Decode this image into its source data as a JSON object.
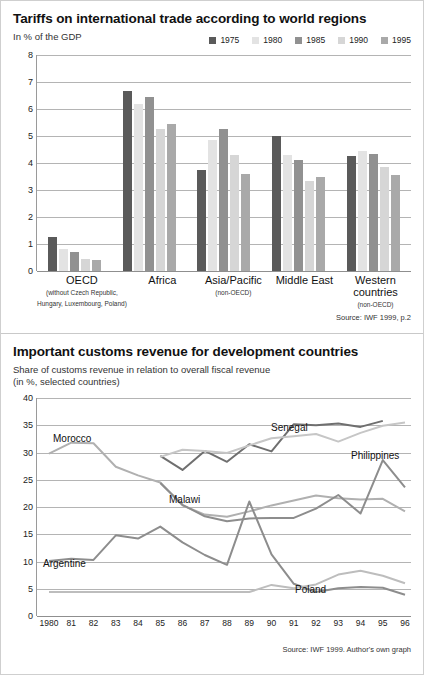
{
  "chart_data": [
    {
      "type": "bar",
      "title": "Tariffs on international trade according to world regions",
      "subtitle": "In % of the GDP",
      "ylabel": "",
      "xlabel": "",
      "ylim": [
        0,
        8
      ],
      "yticks": [
        0,
        1,
        2,
        3,
        4,
        5,
        6,
        7,
        8
      ],
      "grid": true,
      "legend_position": "top-right",
      "source": "Source: IWF 1999, p.2",
      "categories": [
        {
          "name": "OECD",
          "note": "(without Czech Republic,\nHungary, Luxembourg, Poland)"
        },
        {
          "name": "Africa",
          "note": ""
        },
        {
          "name": "Asia/Pacific",
          "note": "(non-OECD)"
        },
        {
          "name": "Middle East",
          "note": ""
        },
        {
          "name": "Western countries",
          "note": "(non-OECD)"
        }
      ],
      "series": [
        {
          "name": "1975",
          "color": "#5a5a5a",
          "values": [
            1.25,
            6.65,
            3.75,
            5.0,
            4.25
          ]
        },
        {
          "name": "1980",
          "color": "#e3e3e3",
          "values": [
            0.8,
            6.2,
            4.85,
            4.3,
            4.45
          ]
        },
        {
          "name": "1985",
          "color": "#919191",
          "values": [
            0.7,
            6.45,
            5.25,
            4.1,
            4.35
          ]
        },
        {
          "name": "1990",
          "color": "#d6d6d6",
          "values": [
            0.45,
            5.25,
            4.3,
            3.35,
            3.85
          ]
        },
        {
          "name": "1995",
          "color": "#a9a9a9",
          "values": [
            0.4,
            5.45,
            3.6,
            3.5,
            3.55
          ]
        }
      ]
    },
    {
      "type": "line",
      "title": "Important customs revenue for development countries",
      "subtitle_line1": "Share of customs revenue in relation to overall fiscal revenue",
      "subtitle_line2": "(in %, selected countries)",
      "ylabel": "",
      "xlabel": "",
      "ylim": [
        0,
        40
      ],
      "yticks": [
        0,
        5,
        10,
        15,
        20,
        25,
        30,
        35,
        40
      ],
      "grid": true,
      "source": "Source: IWF 1999. Author's own graph",
      "x": [
        "1980",
        "81",
        "82",
        "83",
        "84",
        "85",
        "86",
        "87",
        "88",
        "89",
        "90",
        "91",
        "92",
        "93",
        "94",
        "95",
        "96"
      ],
      "series": [
        {
          "name": "Morocco",
          "color": "#b0b0b0",
          "values": [
            29.8,
            31.8,
            31.7,
            27.4,
            25.8,
            24.5,
            20.3,
            18.6,
            18.2,
            19.2,
            20.3,
            21.2,
            22.1,
            21.6,
            21.4,
            21.5,
            19.2
          ],
          "label_x": 40,
          "label_y": 35
        },
        {
          "name": "Senegal",
          "color": "#6f6f6f",
          "values": [
            null,
            null,
            null,
            null,
            null,
            29.4,
            26.8,
            30.3,
            28.3,
            31.5,
            30.2,
            35.2,
            35.0,
            35.3,
            34.7,
            35.8,
            null
          ],
          "label_x": 258,
          "label_y": 24
        },
        {
          "name": "Philippines",
          "color": "#c6c6c6",
          "values": [
            null,
            null,
            null,
            null,
            null,
            29.2,
            30.5,
            30.3,
            29.9,
            31.3,
            32.6,
            33.0,
            33.4,
            32.0,
            33.6,
            34.9,
            35.5
          ],
          "label_x": 338,
          "label_y": 52
        },
        {
          "name": "Malawi",
          "color": "#8d8d8d",
          "values": [
            null,
            null,
            null,
            null,
            null,
            24.4,
            20.4,
            18.3,
            17.4,
            17.9,
            18.0,
            18.0,
            19.7,
            22.2,
            18.8,
            28.6,
            23.6
          ],
          "label_x": 156,
          "label_y": 96
        },
        {
          "name": "Argentine",
          "color": "#8d8d8d",
          "values": [
            10.1,
            10.5,
            10.3,
            14.8,
            14.2,
            16.4,
            13.5,
            11.2,
            9.4,
            21.0,
            11.3,
            5.9,
            4.4,
            5.1,
            5.3,
            5.2,
            3.9
          ],
          "label_x": 30,
          "label_y": 160
        },
        {
          "name": "Poland",
          "color": "#bdbdbd",
          "values": [
            4.4,
            4.4,
            4.4,
            4.4,
            4.4,
            4.4,
            4.4,
            4.4,
            4.4,
            4.4,
            5.7,
            5.1,
            5.8,
            7.6,
            8.3,
            7.4,
            6.0
          ],
          "label_x": 282,
          "label_y": 186
        }
      ]
    }
  ]
}
